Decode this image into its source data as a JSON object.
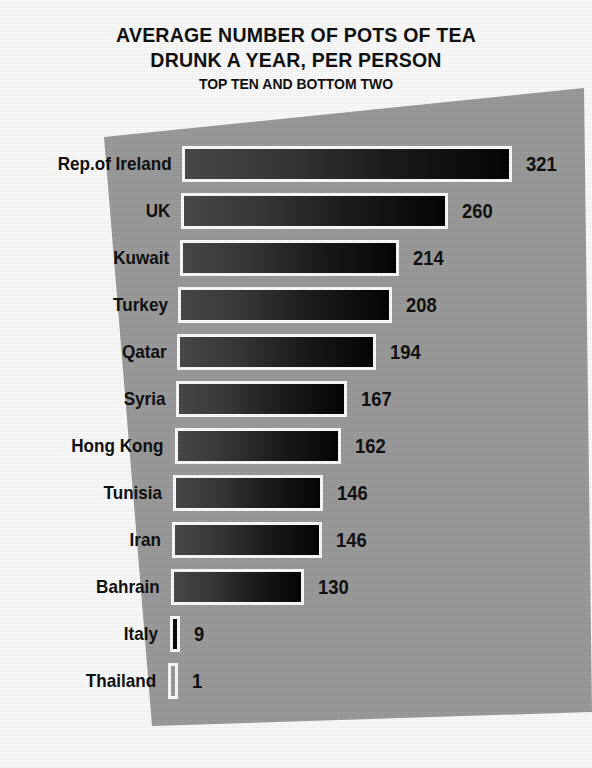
{
  "chart_data": {
    "type": "bar",
    "orientation": "horizontal",
    "title": "AVERAGE NUMBER OF POTS OF TEA DRUNK A YEAR, PER PERSON",
    "title_lines": [
      "AVERAGE NUMBER OF POTS OF TEA",
      "DRUNK A YEAR, PER PERSON"
    ],
    "subtitle": "TOP TEN AND BOTTOM TWO",
    "categories": [
      "Rep.of Ireland",
      "UK",
      "Kuwait",
      "Turkey",
      "Qatar",
      "Syria",
      "Hong Kong",
      "Tunisia",
      "Iran",
      "Bahrain",
      "Italy",
      "Thailand"
    ],
    "values": [
      321,
      260,
      214,
      208,
      194,
      167,
      162,
      146,
      146,
      130,
      9,
      1
    ],
    "value_labels": [
      "321",
      "260",
      "214",
      "208",
      "194",
      "167",
      "162",
      "146",
      "146",
      "130",
      "9",
      "1"
    ],
    "xlabel": "",
    "ylabel": "",
    "xlim": [
      0,
      321
    ],
    "grid": false,
    "legend": false,
    "data_labels": true,
    "colors": {
      "background": "#ffffff",
      "panel": "#9d9d9d",
      "bar_light": "#4a4a4a",
      "bar_dark": "#050505",
      "bar_outline": "#ffffff",
      "text": "#111111"
    }
  }
}
